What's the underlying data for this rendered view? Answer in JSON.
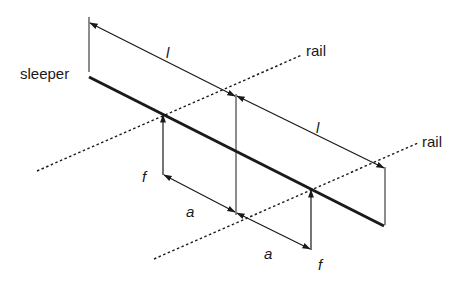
{
  "diagram": {
    "type": "sleeper-load-schematic",
    "labels": {
      "sleeper": "sleeper",
      "rail_top": "rail",
      "rail_bottom": "rail",
      "length_top": "l",
      "length_bottom": "l",
      "force_left": "f",
      "force_right": "f",
      "spacing_left": "a",
      "spacing_right": "a"
    },
    "colors": {
      "line": "#1a1a1a",
      "background": "#ffffff"
    }
  }
}
